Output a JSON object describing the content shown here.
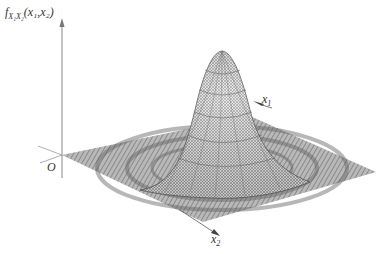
{
  "figure": {
    "zaxis_label_func": "f",
    "zaxis_label_sub": "X₁X₂",
    "zaxis_label_args": "(x₁,x₂)",
    "origin_label": "O",
    "x1_label": "x",
    "x1_sub": "1",
    "x2_label": "x",
    "x2_sub": "2"
  },
  "colors": {
    "mesh": "#555555",
    "axis": "#888888",
    "plane": "#8a8a8a",
    "background": "#ffffff"
  }
}
